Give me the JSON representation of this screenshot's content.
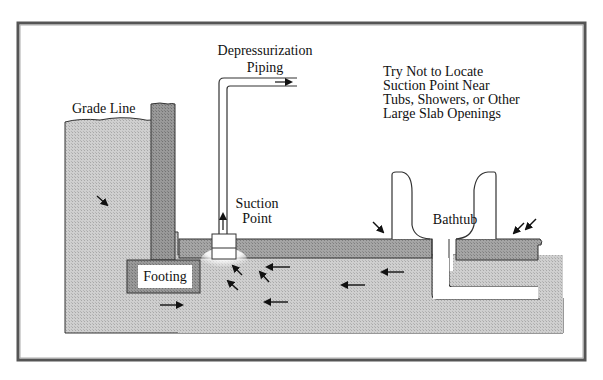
{
  "diagram": {
    "labels": {
      "depressurization_line1": "Depressurization",
      "depressurization_line2": "Piping",
      "note_line1": "Try Not to Locate",
      "note_line2": "Suction Point Near",
      "note_line3": "Tubs, Showers, or Other",
      "note_line4": "Large Slab Openings",
      "grade_line": "Grade Line",
      "suction_line1": "Suction",
      "suction_line2": "Point",
      "bathtub": "Bathtub",
      "footing": "Footing"
    },
    "colors": {
      "soil": "#c4c4c4",
      "slab": "#9a9a9a",
      "wall": "#8e8e8e",
      "outline": "#333333",
      "background": "#ffffff"
    }
  }
}
